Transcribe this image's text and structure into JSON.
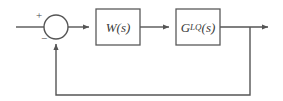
{
  "diagram": {
    "type": "control-system-block-diagram",
    "title": "",
    "colors": {
      "line": "#555555",
      "block_stroke": "#5a5a5a",
      "block_fill": "#ffffff",
      "text": "#3a3a3a",
      "background": "#ffffff"
    },
    "summing_junction": {
      "name": "summing-junction",
      "shape": "circle",
      "center_x": 56,
      "center_y": 27,
      "radius": 12,
      "input_sign": "+",
      "feedback_sign": "−"
    },
    "blocks": [
      {
        "id": "w-block",
        "label": "W(s)",
        "base": "W",
        "subscript": "",
        "argument": "(s)",
        "x": 96,
        "y": 9,
        "width": 44,
        "height": 36
      },
      {
        "id": "g-block",
        "label": "G_LQ(s)",
        "base": "G",
        "subscript": "LQ",
        "argument": "(s)",
        "x": 176,
        "y": 9,
        "width": 44,
        "height": 36
      }
    ],
    "signals": [
      {
        "id": "reference-input",
        "label": "",
        "from_x": 16,
        "to_x": 44,
        "y": 27
      },
      {
        "id": "error-signal",
        "label": "",
        "from_x": 68,
        "to_x": 96,
        "y": 27
      },
      {
        "id": "w-to-g-signal",
        "label": "",
        "from_x": 140,
        "to_x": 176,
        "y": 27
      },
      {
        "id": "plant-output",
        "label": "",
        "from_x": 220,
        "to_x": 275,
        "y": 27
      },
      {
        "id": "feedback-path",
        "label": "",
        "tap_x": 250,
        "bottom_y": 95,
        "return_x": 56
      }
    ]
  }
}
